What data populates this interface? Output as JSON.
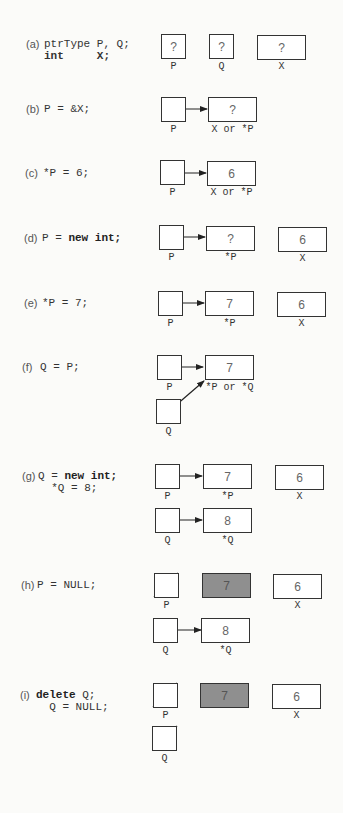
{
  "steps": [
    {
      "tag": "(a)",
      "code": [
        "ptrType P, Q;",
        "int     X;"
      ],
      "keywords": [
        "int"
      ],
      "boxes": [
        {
          "name": "P",
          "value": "?",
          "label": "P"
        },
        {
          "name": "Q",
          "value": "?",
          "label": "Q"
        },
        {
          "name": "X",
          "value": "?",
          "label": "X"
        }
      ]
    },
    {
      "tag": "(b)",
      "code": [
        "P = &X;"
      ],
      "boxes": [
        {
          "name": "P",
          "value": "",
          "label": "P",
          "points_to": "X"
        },
        {
          "name": "X",
          "value": "?",
          "label": "X or *P"
        }
      ]
    },
    {
      "tag": "(c)",
      "code": [
        "*P = 6;"
      ],
      "boxes": [
        {
          "name": "P",
          "value": "",
          "label": "P",
          "points_to": "X"
        },
        {
          "name": "X",
          "value": "6",
          "label": "X or *P"
        }
      ]
    },
    {
      "tag": "(d)",
      "code": [
        "P = new int;"
      ],
      "keywords": [
        "new int;"
      ],
      "boxes": [
        {
          "name": "P",
          "value": "",
          "label": "P",
          "points_to": "heap1"
        },
        {
          "name": "heap1",
          "value": "?",
          "label": "*P"
        },
        {
          "name": "X",
          "value": "6",
          "label": "X"
        }
      ]
    },
    {
      "tag": "(e)",
      "code": [
        "*P = 7;"
      ],
      "boxes": [
        {
          "name": "P",
          "value": "",
          "label": "P",
          "points_to": "heap1"
        },
        {
          "name": "heap1",
          "value": "7",
          "label": "*P"
        },
        {
          "name": "X",
          "value": "6",
          "label": "X"
        }
      ]
    },
    {
      "tag": "(f)",
      "code": [
        "Q = P;"
      ],
      "boxes": [
        {
          "name": "P",
          "value": "",
          "label": "P",
          "points_to": "heap1"
        },
        {
          "name": "heap1",
          "value": "7",
          "label": "*P or *Q"
        },
        {
          "name": "Q",
          "value": "",
          "label": "Q",
          "points_to": "heap1"
        }
      ]
    },
    {
      "tag": "(g)",
      "code": [
        "Q = new int;",
        "  *Q = 8;"
      ],
      "keywords": [
        "new int;"
      ],
      "boxes": [
        {
          "name": "P",
          "value": "",
          "label": "P",
          "points_to": "heap1"
        },
        {
          "name": "heap1",
          "value": "7",
          "label": "*P"
        },
        {
          "name": "X",
          "value": "6",
          "label": "X"
        },
        {
          "name": "Q",
          "value": "",
          "label": "Q",
          "points_to": "heap2"
        },
        {
          "name": "heap2",
          "value": "8",
          "label": "*Q"
        }
      ]
    },
    {
      "tag": "(h)",
      "code": [
        "P = NULL;"
      ],
      "boxes": [
        {
          "name": "P",
          "value": "NULL",
          "label": "P"
        },
        {
          "name": "heap1",
          "value": "7",
          "label": "",
          "inaccessible": true
        },
        {
          "name": "X",
          "value": "6",
          "label": "X"
        },
        {
          "name": "Q",
          "value": "",
          "label": "Q",
          "points_to": "heap2"
        },
        {
          "name": "heap2",
          "value": "8",
          "label": "*Q"
        }
      ]
    },
    {
      "tag": "(i)",
      "code": [
        "delete Q;",
        "  Q = NULL;"
      ],
      "keywords": [
        "delete"
      ],
      "boxes": [
        {
          "name": "P",
          "value": "NULL",
          "label": "P"
        },
        {
          "name": "heap1",
          "value": "7",
          "label": "",
          "inaccessible": true
        },
        {
          "name": "X",
          "value": "6",
          "label": "X"
        },
        {
          "name": "Q",
          "value": "NULL",
          "label": "Q"
        }
      ]
    }
  ],
  "colors": {
    "ink": "#333333",
    "inaccessible_fill": "#8f8f8f",
    "background": "#fbfbf9"
  }
}
